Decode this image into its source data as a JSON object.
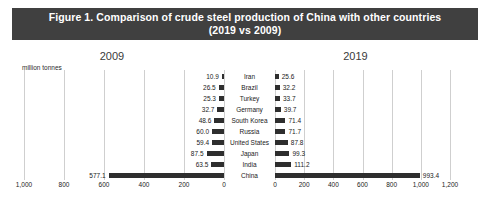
{
  "figure": {
    "title_line1": "Figure 1.  Comparison of crude steel production of China with other countries",
    "title_line2": "(2019 vs 2009)",
    "unit_label": "million tonnes",
    "left_year": "2009",
    "right_year": "2019",
    "title_bg": "#404040",
    "title_fg": "#ffffff",
    "bar_color": "#2e2e2e",
    "grid_color": "#cfcfcf"
  },
  "chart_data": {
    "type": "bar",
    "title": "Figure 1.  Comparison of crude steel production of China with other countries (2019 vs 2009)",
    "xlabel": "million tonnes",
    "ylabel": "",
    "orientation": "horizontal",
    "grid": true,
    "legend": "none",
    "categories": [
      "Iran",
      "Brazil",
      "Turkey",
      "Germany",
      "South Korea",
      "Russia",
      "United States",
      "Japan",
      "India",
      "China"
    ],
    "series": [
      {
        "name": "2009",
        "values": [
          10.9,
          26.5,
          25.3,
          32.7,
          48.6,
          60.0,
          59.4,
          87.5,
          63.5,
          577.1
        ],
        "axis": "left",
        "direction": "reversed",
        "xlim": [
          0,
          1000
        ]
      },
      {
        "name": "2019",
        "values": [
          25.6,
          32.2,
          33.7,
          39.7,
          71.4,
          71.7,
          87.8,
          99.3,
          111.2,
          993.4
        ],
        "axis": "right",
        "direction": "normal",
        "xlim": [
          0,
          1200
        ]
      }
    ],
    "left_ticks": [
      "1,000",
      "800",
      "600",
      "400",
      "200",
      "0"
    ],
    "left_tick_values": [
      1000,
      800,
      600,
      400,
      200,
      0
    ],
    "right_ticks": [
      "0",
      "200",
      "400",
      "600",
      "800",
      "1,000",
      "1,200"
    ],
    "right_tick_values": [
      0,
      200,
      400,
      600,
      800,
      1000,
      1200
    ]
  }
}
